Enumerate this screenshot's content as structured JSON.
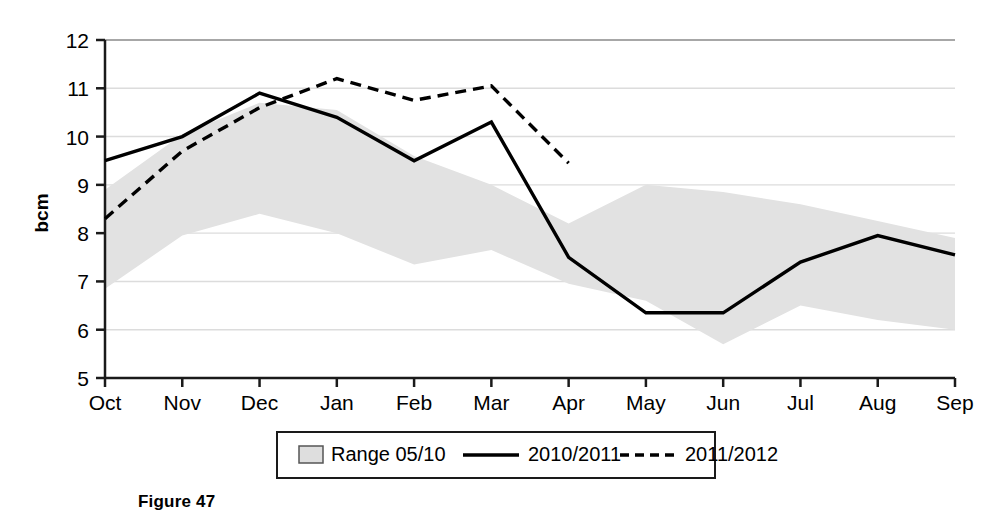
{
  "caption": "Figure 47",
  "chart_data": {
    "type": "line",
    "title": "",
    "xlabel": "",
    "ylabel": "bcm",
    "categories": [
      "Oct",
      "Nov",
      "Dec",
      "Jan",
      "Feb",
      "Mar",
      "Apr",
      "May",
      "Jun",
      "Jul",
      "Aug",
      "Sep"
    ],
    "ylim": [
      5,
      12
    ],
    "yticks": [
      5,
      6,
      7,
      8,
      9,
      10,
      11,
      12
    ],
    "ytick_labels": [
      "5",
      "6",
      "7",
      "8",
      "9",
      "10",
      "11",
      "12"
    ],
    "grid": true,
    "grid_axis": "y",
    "legend_position": "bottom",
    "series": [
      {
        "name": "Range 05/10",
        "type": "band",
        "style": "filled-area",
        "color": "#e2e2e2",
        "upper": [
          8.9,
          10.05,
          10.7,
          10.55,
          9.6,
          9.0,
          8.2,
          9.0,
          8.85,
          8.6,
          8.25,
          7.9
        ],
        "lower": [
          6.85,
          7.95,
          8.4,
          8.0,
          7.35,
          7.65,
          6.95,
          6.6,
          5.7,
          6.5,
          6.2,
          6.0
        ]
      },
      {
        "name": "2010/2011",
        "type": "line",
        "style": "solid",
        "color": "#000000",
        "values": [
          9.5,
          10.0,
          10.9,
          10.4,
          9.5,
          10.3,
          7.5,
          6.35,
          6.35,
          7.4,
          7.95,
          7.55
        ]
      },
      {
        "name": "2011/2012",
        "type": "line",
        "style": "dashed",
        "color": "#000000",
        "values": [
          8.3,
          9.7,
          10.6,
          11.2,
          10.75,
          11.05,
          9.45,
          null,
          null,
          null,
          null,
          null
        ]
      }
    ],
    "legend": [
      {
        "label": "Range 05/10",
        "marker": "filled-square-swatch"
      },
      {
        "label": "2010/2011",
        "marker": "solid-line"
      },
      {
        "label": "2011/2012",
        "marker": "dashed-line"
      }
    ]
  }
}
